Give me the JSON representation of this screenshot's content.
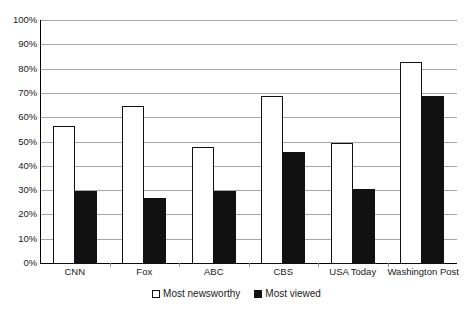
{
  "chart_data": {
    "type": "bar",
    "title": "",
    "subtitle": "",
    "xlabel": "",
    "ylabel": "",
    "ylim": [
      0,
      100
    ],
    "y_unit": "%",
    "grid": true,
    "legend_position": "bottom-center",
    "y_ticks": [
      "0%",
      "10%",
      "20%",
      "30%",
      "40%",
      "50%",
      "60%",
      "70%",
      "80%",
      "90%",
      "100%"
    ],
    "y_tick_values": [
      0,
      10,
      20,
      30,
      40,
      50,
      60,
      70,
      80,
      90,
      100
    ],
    "categories": [
      "CNN",
      "Fox",
      "ABC",
      "CBS",
      "USA Today",
      "Washington Post"
    ],
    "series": [
      {
        "name": "Most newsworthy",
        "color": "#ffffff",
        "edge_color": "#111111",
        "values": [
          57,
          65,
          48,
          69,
          50,
          83
        ]
      },
      {
        "name": "Most viewed",
        "color": "#111111",
        "edge_color": "#111111",
        "values": [
          30,
          27,
          30,
          46,
          31,
          69
        ]
      }
    ]
  },
  "legend": {
    "items": [
      {
        "label": "Most newsworthy",
        "marker": "hollow-square-marker"
      },
      {
        "label": "Most viewed",
        "marker": "filled-square-marker"
      }
    ]
  },
  "colors": {
    "gridline": "#a6a6a6",
    "axis": "#000000",
    "text": "#1a1a1a",
    "background": "#ffffff"
  }
}
